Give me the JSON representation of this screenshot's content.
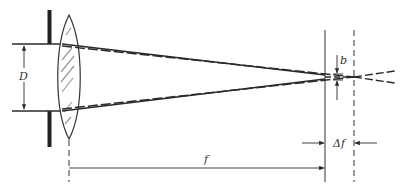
{
  "diagram": {
    "type": "optics",
    "labels": {
      "aperture_diameter": "D",
      "spot_size": "b",
      "focal_length": "f",
      "depth_of_focus": "Δf"
    },
    "colors": {
      "line": "#2a2a2a",
      "lens_hatch": "#8a8a8a",
      "background": "#ffffff"
    }
  }
}
